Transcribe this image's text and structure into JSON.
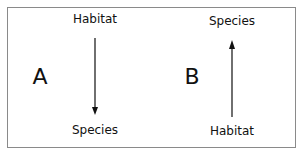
{
  "panels": [
    {
      "letter": "A",
      "top_label": "Habitat",
      "bottom_label": "Species",
      "arrow_direction": "down"
    },
    {
      "letter": "B",
      "top_label": "Species",
      "bottom_label": "Habitat",
      "arrow_direction": "up"
    }
  ],
  "colors": {
    "arrow": "#222222",
    "border": "#8a8a8a",
    "text": "#111111"
  }
}
